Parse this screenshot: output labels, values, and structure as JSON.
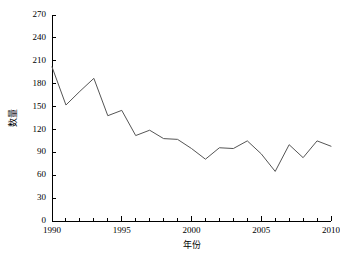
{
  "chart_data": {
    "type": "line",
    "title": "",
    "xlabel": "年份",
    "ylabel": "数量",
    "x": [
      1990,
      1991,
      1992,
      1993,
      1994,
      1995,
      1996,
      1997,
      1998,
      1999,
      2000,
      2001,
      2002,
      2003,
      2004,
      2005,
      2006,
      2007,
      2008,
      2009,
      2010
    ],
    "values": [
      202,
      152,
      170,
      187,
      138,
      145,
      112,
      119,
      108,
      107,
      95,
      81,
      96,
      95,
      105,
      88,
      65,
      100,
      83,
      105,
      98
    ],
    "series": [
      {
        "name": "数量",
        "values": [
          202,
          152,
          170,
          187,
          138,
          145,
          112,
          119,
          108,
          107,
          95,
          81,
          96,
          95,
          105,
          88,
          65,
          100,
          83,
          105,
          98
        ]
      }
    ],
    "xlim": [
      1990,
      2010
    ],
    "ylim": [
      0,
      270
    ],
    "ytick_labels": [
      "0",
      "30",
      "60",
      "90",
      "120",
      "150",
      "180",
      "210",
      "240",
      "270"
    ],
    "ytick_values": [
      0,
      30,
      60,
      90,
      120,
      150,
      180,
      210,
      240,
      270
    ],
    "xtick_labels": [
      "1990",
      "1995",
      "2000",
      "2005",
      "2010"
    ],
    "xtick_values": [
      1990,
      1995,
      2000,
      2005,
      2010
    ],
    "x_minor_step": 1,
    "grid": false,
    "legend": "none",
    "line_color": "#555555",
    "axis_color": "#000000",
    "background_color": "#ffffff"
  }
}
